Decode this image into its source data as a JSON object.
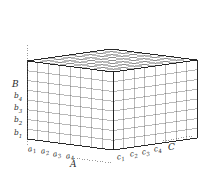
{
  "figure": {
    "background_color": "#ffffff",
    "line_color": "#3a3a3a",
    "edge_color": "#1a1a1a",
    "label_color": "#2b2b2b"
  },
  "axes": {
    "a": {
      "name": "A",
      "label": "A",
      "position": "bottom-left",
      "ticks": [
        {
          "label": "a",
          "sub": "1"
        },
        {
          "label": "a",
          "sub": "2"
        },
        {
          "label": "a",
          "sub": "3"
        },
        {
          "label": "a",
          "sub": "4"
        }
      ]
    },
    "b": {
      "name": "B",
      "label": "B",
      "position": "left-vertical",
      "ticks": [
        {
          "label": "b",
          "sub": "1"
        },
        {
          "label": "b",
          "sub": "2"
        },
        {
          "label": "b",
          "sub": "3"
        },
        {
          "label": "b",
          "sub": "4"
        }
      ]
    },
    "c": {
      "name": "C",
      "label": "C",
      "position": "bottom-right",
      "ticks": [
        {
          "label": "c",
          "sub": "1"
        },
        {
          "label": "c",
          "sub": "2"
        },
        {
          "label": "c",
          "sub": "3"
        },
        {
          "label": "c",
          "sub": "4"
        }
      ]
    }
  },
  "grid": {
    "divisions_a": 8,
    "divisions_b": 8,
    "divisions_c": 8
  }
}
